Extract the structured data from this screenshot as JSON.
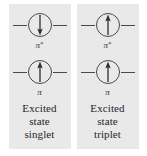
{
  "figure": {
    "background_color": "#ffffff",
    "panel_color": "#e9e9e9",
    "line_color": "#4a4a4a",
    "text_color": "#262626"
  },
  "panels": [
    {
      "id": "excited-state-singlet",
      "orbitals": [
        {
          "id": "antibonding",
          "label_symbol": "π",
          "label_superscript": "*",
          "arrow_direction": "down",
          "electron_count": 1
        },
        {
          "id": "bonding",
          "label_symbol": "π",
          "label_superscript": "",
          "arrow_direction": "up",
          "electron_count": 1
        }
      ],
      "caption_lines": [
        "Excited",
        "state",
        "singlet"
      ]
    },
    {
      "id": "excited-state-triplet",
      "orbitals": [
        {
          "id": "antibonding",
          "label_symbol": "π",
          "label_superscript": "*",
          "arrow_direction": "up",
          "electron_count": 1
        },
        {
          "id": "bonding",
          "label_symbol": "π",
          "label_superscript": "",
          "arrow_direction": "up",
          "electron_count": 1
        }
      ],
      "caption_lines": [
        "Excited",
        "state",
        "triplet"
      ]
    }
  ]
}
